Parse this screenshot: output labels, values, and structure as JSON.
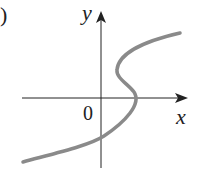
{
  "figure": {
    "part_label": ")",
    "x_label": "x",
    "y_label": "y",
    "origin_label": "0",
    "curve_color": "#8a8a8a",
    "axis_color": "#222222"
  }
}
